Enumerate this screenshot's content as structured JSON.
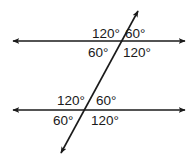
{
  "diagram": {
    "colors": {
      "stroke": "#1a1a1a",
      "background": "#ffffff"
    },
    "top_intersection": {
      "upper_left": "120°",
      "upper_right": "60°",
      "lower_left": "60°",
      "lower_right": "120°"
    },
    "bottom_intersection": {
      "upper_left": "120°",
      "upper_right": "60°",
      "lower_left": "60°",
      "lower_right": "120°"
    },
    "icons": {
      "arrowheads": "arrow-icon"
    }
  }
}
